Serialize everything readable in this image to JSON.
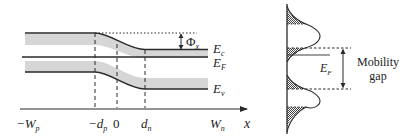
{
  "band_diagram": {
    "labels": {
      "conduction_band": "E",
      "conduction_band_sub": "c",
      "fermi_level": "E",
      "fermi_level_sub": "F",
      "valence_band": "E",
      "valence_band_sub": "v",
      "barrier": "Φ",
      "barrier_sub": "x"
    },
    "x_axis": {
      "label": "x",
      "ticks": [
        {
          "main": "−W",
          "sub": "p"
        },
        {
          "main": "−d",
          "sub": "p"
        },
        {
          "main": "0",
          "sub": ""
        },
        {
          "main": "d",
          "sub": "n"
        },
        {
          "main": "W",
          "sub": "n"
        }
      ]
    }
  },
  "density_of_states": {
    "fermi_label": "E",
    "fermi_label_sub": "F",
    "gap_label_line1": "Mobility",
    "gap_label_line2": "gap"
  },
  "colors": {
    "line": "#2a2a2a",
    "shade": "#d4d4d4",
    "hatch": "#555555"
  }
}
